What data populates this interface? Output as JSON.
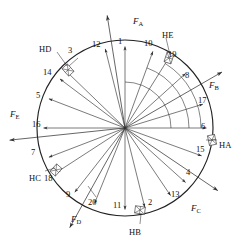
{
  "figure": {
    "type": "radial-force-diagram",
    "center": {
      "x": 125,
      "y": 128
    },
    "radius": 88,
    "stroke_color": "#333333",
    "circle_color": "#222222"
  },
  "chart_data": {
    "type": "scatter",
    "title": "",
    "xlabel": "",
    "ylabel": "",
    "categories": [
      "1",
      "2",
      "3",
      "4",
      "5",
      "6",
      "7",
      "8",
      "9",
      "10",
      "11",
      "12",
      "13",
      "14",
      "15",
      "16",
      "17",
      "18",
      "19",
      "20"
    ],
    "values": [
      1,
      2,
      3,
      4,
      5,
      6,
      7,
      8,
      9,
      10,
      11,
      12,
      13,
      14,
      15,
      16,
      17,
      18,
      19,
      20
    ],
    "series": [
      {
        "name": "node-angles-deg",
        "values": [
          90,
          266,
          136,
          318,
          160,
          0,
          201,
          42,
          233,
          68,
          272,
          105,
          304,
          143,
          349,
          180,
          17,
          216,
          60,
          248
        ]
      }
    ]
  },
  "rays": [
    {
      "id": "ray-1",
      "angle": 90,
      "node": "1"
    },
    {
      "id": "ray-12",
      "angle": 104,
      "node": "12"
    },
    {
      "id": "ray-3",
      "angle": 136,
      "node": "3"
    },
    {
      "id": "ray-14",
      "angle": 143,
      "node": "14"
    },
    {
      "id": "ray-5",
      "angle": 159,
      "node": "5"
    },
    {
      "id": "ray-16",
      "angle": 180,
      "node": "16"
    },
    {
      "id": "ray-7",
      "angle": 201,
      "node": "7"
    },
    {
      "id": "ray-18",
      "angle": 213,
      "node": "18"
    },
    {
      "id": "ray-9",
      "angle": 232,
      "node": "9"
    },
    {
      "id": "ray-20",
      "angle": 248,
      "node": "20"
    },
    {
      "id": "ray-11",
      "angle": 270,
      "node": "11"
    },
    {
      "id": "ray-2",
      "angle": 284,
      "node": "2"
    },
    {
      "id": "ray-13",
      "angle": 304,
      "node": "13"
    },
    {
      "id": "ray-4",
      "angle": 318,
      "node": "4"
    },
    {
      "id": "ray-15",
      "angle": 340,
      "node": "15"
    },
    {
      "id": "ray-6",
      "angle": 0,
      "node": "6"
    },
    {
      "id": "ray-17",
      "angle": 17,
      "node": "17"
    },
    {
      "id": "ray-8",
      "angle": 42,
      "node": "8"
    },
    {
      "id": "ray-19",
      "angle": 58,
      "node": "19"
    },
    {
      "id": "ray-10",
      "angle": 70,
      "node": "10"
    }
  ],
  "numbers": [
    {
      "label": "1",
      "x": 122,
      "y": 42
    },
    {
      "label": "12",
      "x": 96,
      "y": 45
    },
    {
      "label": "3",
      "x": 72,
      "y": 51
    },
    {
      "label": "14",
      "x": 47,
      "y": 73
    },
    {
      "label": "5",
      "x": 40,
      "y": 96
    },
    {
      "label": "16",
      "x": 36,
      "y": 125
    },
    {
      "label": "7",
      "x": 35,
      "y": 153
    },
    {
      "label": "18",
      "x": 48,
      "y": 179
    },
    {
      "label": "9",
      "x": 70,
      "y": 195
    },
    {
      "label": "20",
      "x": 92,
      "y": 203
    },
    {
      "label": "11",
      "x": 117,
      "y": 206
    },
    {
      "label": "2",
      "x": 152,
      "y": 203
    },
    {
      "label": "13",
      "x": 175,
      "y": 195
    },
    {
      "label": "4",
      "x": 190,
      "y": 173
    },
    {
      "label": "15",
      "x": 200,
      "y": 150
    },
    {
      "label": "6",
      "x": 205,
      "y": 127
    },
    {
      "label": "17",
      "x": 202,
      "y": 101
    },
    {
      "label": "8",
      "x": 189,
      "y": 76
    },
    {
      "label": "19",
      "x": 172,
      "y": 55
    },
    {
      "label": "10",
      "x": 148,
      "y": 44
    }
  ],
  "force_labels": [
    {
      "name": "FA",
      "base": "F",
      "sub": "A",
      "x": 133,
      "y": 17
    },
    {
      "name": "FB",
      "base": "F",
      "sub": "B",
      "x": 209,
      "y": 81
    },
    {
      "name": "FC",
      "base": "F",
      "sub": "C",
      "x": 191,
      "y": 204
    },
    {
      "name": "FD",
      "base": "F",
      "sub": "D",
      "x": 71,
      "y": 215
    },
    {
      "name": "FE",
      "base": "F",
      "sub": "E",
      "x": 10,
      "y": 110
    }
  ],
  "bearing_labels": [
    {
      "name": "HA",
      "label": "HA",
      "x": 219,
      "y": 141
    },
    {
      "name": "HB",
      "label": "HB",
      "x": 129,
      "y": 228
    },
    {
      "name": "HC",
      "label": "HC",
      "x": 29,
      "y": 174
    },
    {
      "name": "HD",
      "label": "HD",
      "x": 39,
      "y": 45
    },
    {
      "name": "HE",
      "label": "HE",
      "x": 162,
      "y": 31
    }
  ],
  "bearings": [
    {
      "name": "bearing-HA",
      "x": 212,
      "y": 140,
      "rot": 78
    },
    {
      "name": "bearing-HB",
      "x": 140,
      "y": 210,
      "rot": 8
    },
    {
      "name": "bearing-HC",
      "x": 56,
      "y": 170,
      "rot": 132
    },
    {
      "name": "bearing-HD",
      "x": 68,
      "y": 70,
      "rot": 48
    },
    {
      "name": "bearing-HE",
      "x": 169,
      "y": 58,
      "rot": 108
    }
  ]
}
